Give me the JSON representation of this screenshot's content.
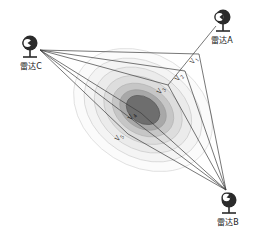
{
  "figure": {
    "type": "multistatic-radar-target-diagram",
    "background_color": "#ffffff",
    "width": 263,
    "height": 238
  },
  "radars": [
    {
      "id": "A",
      "label": "雷达A",
      "icon": "radar-dish-icon",
      "x": 222,
      "y": 14,
      "dish_direction": "down-left",
      "ray_count": 1
    },
    {
      "id": "B",
      "label": "雷达B",
      "icon": "radar-dish-icon",
      "x": 228,
      "y": 196,
      "dish_direction": "up-left",
      "ray_count": 5
    },
    {
      "id": "C",
      "label": "雷达C",
      "icon": "radar-dish-icon",
      "x": 29,
      "y": 48,
      "dish_direction": "right",
      "ray_count": 5
    }
  ],
  "velocity_labels": [
    {
      "name": "V1",
      "base": "V",
      "sub": "1",
      "x": 191,
      "y": 56,
      "rotation": -62
    },
    {
      "name": "V2",
      "base": "V",
      "sub": "2",
      "x": 176,
      "y": 73,
      "rotation": -62
    },
    {
      "name": "V3",
      "base": "V",
      "sub": "3",
      "x": 158,
      "y": 86,
      "rotation": -62
    },
    {
      "name": "V4",
      "base": "V",
      "sub": "4",
      "x": 129,
      "y": 112,
      "rotation": -62
    },
    {
      "name": "V5",
      "base": "V",
      "sub": "5",
      "x": 116,
      "y": 133,
      "rotation": -62
    }
  ],
  "target": {
    "name": "target-contour-cluster",
    "center_x": 143,
    "center_y": 110,
    "rotation_deg": 32,
    "contours": [
      {
        "rx": 74,
        "ry": 56,
        "fill": "#fbfbfb",
        "stroke": "#d8d8d8"
      },
      {
        "rx": 63,
        "ry": 47,
        "fill": "#f4f4f4",
        "stroke": "#d2d2d2"
      },
      {
        "rx": 52,
        "ry": 39,
        "fill": "#ebebeb",
        "stroke": "#cccccc"
      },
      {
        "rx": 42,
        "ry": 31,
        "fill": "#dddddd",
        "stroke": "#c2c2c2"
      },
      {
        "rx": 33,
        "ry": 24,
        "fill": "#c6c6c6",
        "stroke": "#b4b4b4"
      },
      {
        "rx": 25,
        "ry": 18,
        "fill": "#a8a8a8",
        "stroke": "#9c9c9c"
      },
      {
        "rx": 18,
        "ry": 13,
        "fill": "#6e6e6e",
        "stroke": "#5a5a5a"
      }
    ]
  },
  "colors": {
    "line": "#3c3c3c",
    "text": "#141414",
    "core": "#5a5a5a",
    "background": "#ffffff"
  }
}
